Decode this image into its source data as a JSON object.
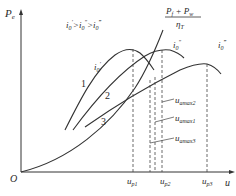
{
  "diagram": {
    "y_axis_label": "P",
    "y_axis_sub": "e",
    "x_axis_label": "u",
    "origin_label": "O",
    "condition_text": "i0' > i0'' > i0'''",
    "resistance_curve": {
      "numerator": "Pf + Pw",
      "denominator": "ηT"
    },
    "gear_labels": {
      "g1": "i0'",
      "g2": "i0''",
      "g3": "i0'''"
    },
    "curve_numbers": [
      "1",
      "2",
      "3"
    ],
    "speed_marks": [
      "up1",
      "up2",
      "up3"
    ],
    "max_speed_labels": [
      "uamax2",
      "uamax1",
      "uamax3"
    ]
  }
}
